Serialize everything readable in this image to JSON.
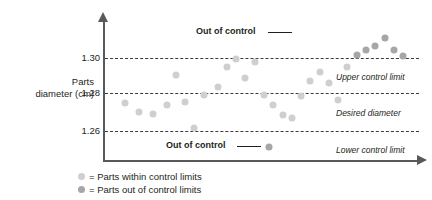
{
  "chart_data": {
    "type": "scatter",
    "title": "",
    "xlabel": "",
    "ylabel": "Parts diameter (cm)",
    "ylabel_line1": "Parts",
    "ylabel_line2": "diameter (cm)",
    "ylim": [
      1.25,
      1.325
    ],
    "yticks": [
      "1.30",
      "1.28",
      "1.26"
    ],
    "ytick_values": [
      1.3,
      1.28,
      1.26
    ],
    "grid": false,
    "legend_position": "below-left",
    "reference_lines": [
      {
        "key": "ucl",
        "label": "Upper control limit",
        "value": 1.3
      },
      {
        "key": "desired",
        "label": "Desired diameter",
        "value": 1.28
      },
      {
        "key": "lcl",
        "label": "Lower control limit",
        "value": 1.26
      }
    ],
    "annotations": [
      {
        "key": "out-of-control-top",
        "text": "Out of control",
        "target_x": 42,
        "target_y": 1.307
      },
      {
        "key": "out-of-control-bottom",
        "text": "Out of control",
        "target_x": 34,
        "target_y": 1.2515
      }
    ],
    "series": [
      {
        "name": "Parts within control limits",
        "key": "within",
        "color": "#cfcfcf",
        "points": [
          {
            "x": 3,
            "y": 1.2752
          },
          {
            "x": 6,
            "y": 1.2702
          },
          {
            "x": 9,
            "y": 1.2692
          },
          {
            "x": 12,
            "y": 1.2745
          },
          {
            "x": 14,
            "y": 1.2905
          },
          {
            "x": 16,
            "y": 1.2758
          },
          {
            "x": 18,
            "y": 1.2617
          },
          {
            "x": 20,
            "y": 1.2795
          },
          {
            "x": 23,
            "y": 1.2843
          },
          {
            "x": 25,
            "y": 1.2952
          },
          {
            "x": 27,
            "y": 1.2995
          },
          {
            "x": 29,
            "y": 1.2888
          },
          {
            "x": 31,
            "y": 1.2978
          },
          {
            "x": 33,
            "y": 1.2798
          },
          {
            "x": 35,
            "y": 1.2745
          },
          {
            "x": 37,
            "y": 1.2688
          },
          {
            "x": 39,
            "y": 1.2672
          },
          {
            "x": 41,
            "y": 1.2792
          },
          {
            "x": 43,
            "y": 1.2872
          },
          {
            "x": 45,
            "y": 1.2925
          },
          {
            "x": 47,
            "y": 1.2862
          },
          {
            "x": 49,
            "y": 1.2772
          },
          {
            "x": 51,
            "y": 1.2952
          }
        ]
      },
      {
        "name": "Parts out of control limits",
        "key": "out",
        "color": "#a6a6a6",
        "points": [
          {
            "x": 53,
            "y": 1.3015
          },
          {
            "x": 55,
            "y": 1.3042
          },
          {
            "x": 57,
            "y": 1.3068
          },
          {
            "x": 59,
            "y": 1.3108
          },
          {
            "x": 61,
            "y": 1.3045
          },
          {
            "x": 63,
            "y": 1.3012
          },
          {
            "x": 34,
            "y": 1.2515
          }
        ]
      }
    ]
  },
  "legend": {
    "items": [
      {
        "key": "within",
        "marker": "circle-light-gray",
        "text": "= Parts within control limits"
      },
      {
        "key": "out",
        "marker": "circle-dark-gray",
        "text": "= Parts out of control limits"
      }
    ]
  }
}
